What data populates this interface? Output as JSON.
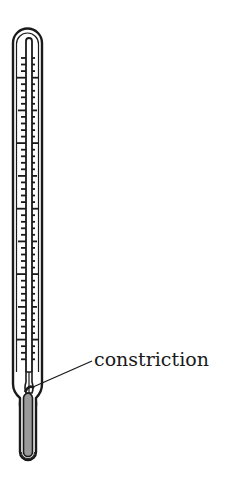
{
  "diagram": {
    "labels": [
      {
        "id": "constriction",
        "text": "constriction",
        "x": 94,
        "y": 366,
        "pointer_to": [
          33,
          387
        ]
      }
    ]
  },
  "colors": {
    "stroke": "#1a1a1a",
    "mercury": "#9a9a9a",
    "background": "#ffffff"
  },
  "scale": {
    "first_tick_y": 58,
    "tick_spacing": 6.55,
    "tick_count": 47,
    "major_every": 10,
    "mid_every": 5,
    "major_offset": 3
  }
}
